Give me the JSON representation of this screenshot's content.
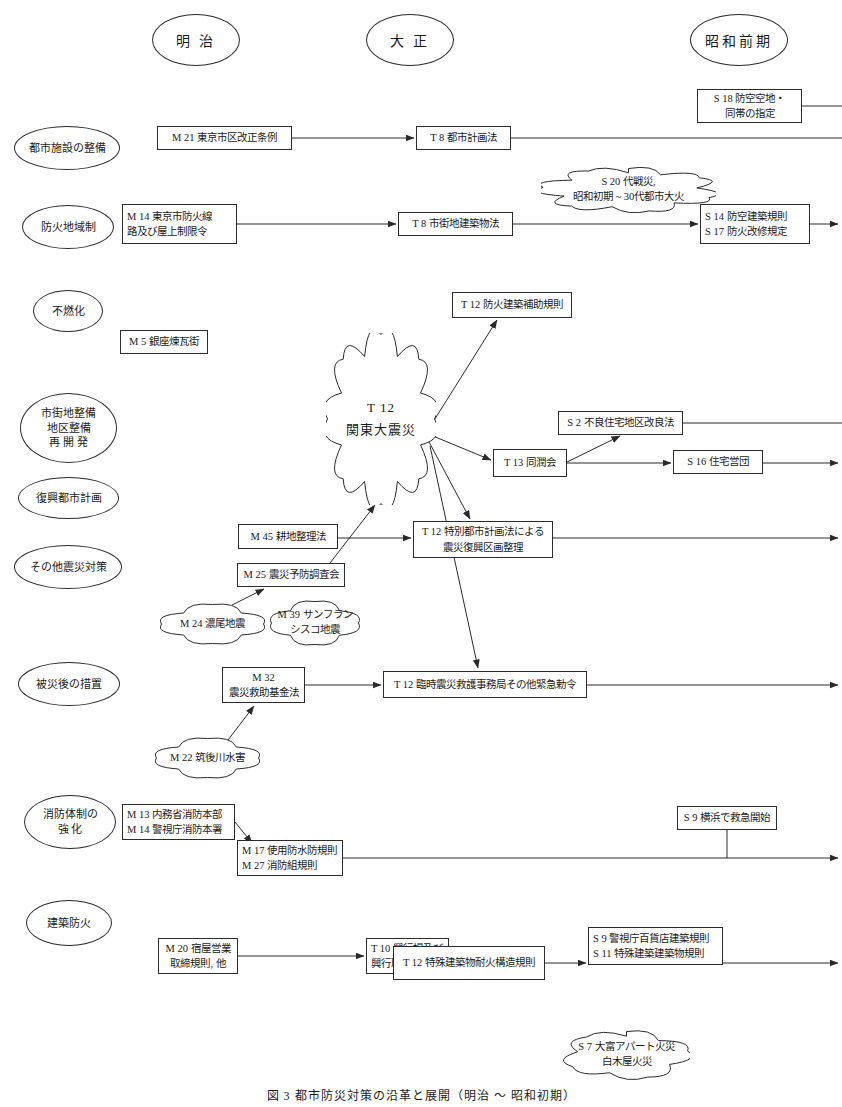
{
  "diagram": {
    "caption": "図 3    都市防災対策の沿革と展開（明治 ～ 昭和初期）",
    "eras": [
      {
        "id": "meiji",
        "label": "明 治",
        "x": 152,
        "y": 14,
        "w": 86,
        "h": 50
      },
      {
        "id": "taisho",
        "label": "大 正",
        "x": 366,
        "y": 14,
        "w": 86,
        "h": 50
      },
      {
        "id": "showa",
        "label": "昭和前期",
        "x": 690,
        "y": 14,
        "w": 96,
        "h": 50
      }
    ],
    "categories": [
      {
        "id": "urban-facilities",
        "lines": [
          "都市施設の整備"
        ],
        "x": 14,
        "y": 126,
        "w": 104,
        "h": 42
      },
      {
        "id": "fire-zone",
        "lines": [
          "防火地域制"
        ],
        "x": 22,
        "y": 205,
        "w": 90,
        "h": 42
      },
      {
        "id": "noncombustible",
        "lines": [
          "不燃化"
        ],
        "x": 33,
        "y": 290,
        "w": 68,
        "h": 40
      },
      {
        "id": "area-improvement",
        "lines": [
          "市街地整備",
          "地区整備",
          "再 開 発"
        ],
        "x": 20,
        "y": 393,
        "w": 95,
        "h": 68
      },
      {
        "id": "recovery-plan",
        "lines": [
          "復興都市計画"
        ],
        "x": 18,
        "y": 477,
        "w": 99,
        "h": 40
      },
      {
        "id": "other-quake",
        "lines": [
          "その他震災対策"
        ],
        "x": 14,
        "y": 545,
        "w": 106,
        "h": 42
      },
      {
        "id": "post-disaster",
        "lines": [
          "被災後の措置"
        ],
        "x": 18,
        "y": 662,
        "w": 100,
        "h": 42
      },
      {
        "id": "firefighting",
        "lines": [
          "消防体制の",
          "強  化"
        ],
        "x": 24,
        "y": 795,
        "w": 90,
        "h": 52
      },
      {
        "id": "building-fire",
        "lines": [
          "建築防火"
        ],
        "x": 26,
        "y": 900,
        "w": 84,
        "h": 44
      }
    ],
    "boxes": [
      {
        "id": "s18-air-defense-open-space",
        "lines": [
          "S 18 防空空地・",
          "同帯の指定"
        ],
        "x": 697,
        "y": 89,
        "w": 105,
        "h": 34,
        "align": "center"
      },
      {
        "id": "m21-tokyo-ward-revision",
        "lines": [
          "M 21 東京市区改正条例"
        ],
        "x": 157,
        "y": 126,
        "w": 135,
        "h": 24,
        "align": "center"
      },
      {
        "id": "t8-city-planning-act",
        "lines": [
          "T 8 都市計画法"
        ],
        "x": 416,
        "y": 126,
        "w": 95,
        "h": 24,
        "align": "center"
      },
      {
        "id": "m14-fireproof-line",
        "lines": [
          "M 14 東京市防火線",
          "路及び屋上制限令"
        ],
        "x": 122,
        "y": 204,
        "w": 115,
        "h": 40,
        "align": "left"
      },
      {
        "id": "t8-urban-building-act",
        "lines": [
          "T 8 市街地建築物法"
        ],
        "x": 398,
        "y": 212,
        "w": 115,
        "h": 24,
        "align": "center"
      },
      {
        "id": "s14-s17-fireproof-rules",
        "lines": [
          "S 14 防空建築規則",
          "S 17 防火改修規定"
        ],
        "x": 700,
        "y": 204,
        "w": 110,
        "h": 40,
        "align": "left"
      },
      {
        "id": "m5-ginza-brick-town",
        "lines": [
          "M 5 銀座煉瓦街"
        ],
        "x": 120,
        "y": 330,
        "w": 88,
        "h": 24,
        "align": "center"
      },
      {
        "id": "t12-fireproof-subsidy",
        "lines": [
          "T 12 防火建築補助規則"
        ],
        "x": 452,
        "y": 292,
        "w": 120,
        "h": 26,
        "align": "center"
      },
      {
        "id": "s2-poor-housing-improve",
        "lines": [
          "S 2 不良住宅地区改良法"
        ],
        "x": 558,
        "y": 411,
        "w": 125,
        "h": 24,
        "align": "center"
      },
      {
        "id": "t13-dojunkai",
        "lines": [
          "T 13 同潤会"
        ],
        "x": 493,
        "y": 449,
        "w": 74,
        "h": 28,
        "align": "center"
      },
      {
        "id": "s16-housing-corp",
        "lines": [
          "S 16 住宅営団"
        ],
        "x": 673,
        "y": 450,
        "w": 90,
        "h": 24,
        "align": "center"
      },
      {
        "id": "m45-land-rearrangement",
        "lines": [
          "M 45 耕地整理法"
        ],
        "x": 238,
        "y": 524,
        "w": 100,
        "h": 25,
        "align": "center"
      },
      {
        "id": "t12-special-city-planning",
        "lines": [
          "T 12 特別都市計画法による",
          "震災復興区画整理"
        ],
        "x": 413,
        "y": 521,
        "w": 140,
        "h": 37,
        "align": "center"
      },
      {
        "id": "m25-quake-prevention-comm",
        "lines": [
          "M 25 震災予防調査会"
        ],
        "x": 237,
        "y": 563,
        "w": 108,
        "h": 24,
        "align": "center"
      },
      {
        "id": "m32-quake-relief-fund",
        "lines": [
          "M 32",
          "震災救助基金法"
        ],
        "x": 222,
        "y": 667,
        "w": 83,
        "h": 36,
        "align": "center"
      },
      {
        "id": "t12-emergency-relief-office",
        "lines": [
          "T 12 臨時震災救護事務局その他緊急勅令"
        ],
        "x": 383,
        "y": 671,
        "w": 204,
        "h": 27,
        "align": "center"
      },
      {
        "id": "m13-m14-fire-hq",
        "lines": [
          "M 13 内務省消防本部",
          "M 14 警視庁消防本署"
        ],
        "x": 122,
        "y": 804,
        "w": 113,
        "h": 36,
        "align": "left"
      },
      {
        "id": "s9-yokohama-ambulance",
        "lines": [
          "S 9 横浜で救急開始"
        ],
        "x": 677,
        "y": 806,
        "w": 100,
        "h": 24,
        "align": "center"
      },
      {
        "id": "m17-m27-fire-rules",
        "lines": [
          "M 17 使用防水防規則",
          "M 27 消防組規則"
        ],
        "x": 237,
        "y": 840,
        "w": 106,
        "h": 36,
        "align": "left"
      },
      {
        "id": "m20-inn-business-rules",
        "lines": [
          "M 20 宿屋営業",
          "取締規則, 他"
        ],
        "x": 158,
        "y": 938,
        "w": 80,
        "h": 36,
        "align": "center"
      },
      {
        "id": "t10-theatre-rules",
        "lines": [
          "T 10 興行場及び",
          "興行取締規則"
        ],
        "x": 366,
        "y": 938,
        "w": 83,
        "h": 36,
        "align": "left"
      },
      {
        "id": "t12-special-building-fire",
        "lines": [
          "T 12 特殊建築物耐火構造規則"
        ],
        "x": 393,
        "y": 946,
        "w": 152,
        "h": 34,
        "align": "center"
      },
      {
        "id": "s9-s11-building-rules",
        "lines": [
          "S 9 警視庁百貨店建築規則",
          "S 11 特殊建築建築物規則"
        ],
        "x": 588,
        "y": 927,
        "w": 135,
        "h": 38,
        "align": "left"
      }
    ],
    "clouds": [
      {
        "id": "s20-war-damage",
        "lines": [
          "S 20 代戦災,",
          "昭和初期 ~ 30代都市大火"
        ],
        "x": 541,
        "y": 167,
        "w": 175,
        "h": 46
      },
      {
        "id": "t12-great-kanto-quake",
        "lines": [
          "T 12",
          "関東大震災"
        ],
        "x": 326,
        "y": 333,
        "w": 110,
        "h": 172,
        "big": true
      },
      {
        "id": "m24-nobi-quake",
        "lines": [
          "M 24 濃尾地震"
        ],
        "x": 160,
        "y": 603,
        "w": 105,
        "h": 42
      },
      {
        "id": "m39-sanfrancisco-quake",
        "lines": [
          "M 39 サンフラン",
          "シスコ地震"
        ],
        "x": 270,
        "y": 600,
        "w": 90,
        "h": 46
      },
      {
        "id": "m22-chikugo-flood",
        "lines": [
          "M 22 筑後川水害"
        ],
        "x": 155,
        "y": 737,
        "w": 105,
        "h": 42
      },
      {
        "id": "s7-otomi-apartment-fire",
        "lines": [
          "S 7 大富アパート火災",
          "白木屋火災"
        ],
        "x": 563,
        "y": 1030,
        "w": 127,
        "h": 50
      }
    ],
    "connectors": [
      {
        "id": "s18-to-right-edge",
        "type": "line",
        "from": [
          802,
          106
        ],
        "to": [
          842,
          106
        ]
      },
      {
        "id": "m21-to-t8-city-planning",
        "type": "arrow",
        "from": [
          292,
          138
        ],
        "to": [
          414,
          138
        ]
      },
      {
        "id": "t8-city-planning-to-right",
        "type": "line",
        "from": [
          511,
          138
        ],
        "to": [
          842,
          138
        ]
      },
      {
        "id": "m14-to-t8-urban-building",
        "type": "arrow",
        "from": [
          237,
          224
        ],
        "to": [
          396,
          224
        ]
      },
      {
        "id": "t8-urban-building-to-s14",
        "type": "arrow",
        "from": [
          513,
          224
        ],
        "to": [
          698,
          224
        ]
      },
      {
        "id": "s14-to-right-edge",
        "type": "arrow",
        "from": [
          810,
          224
        ],
        "to": [
          838,
          224
        ]
      },
      {
        "id": "kanto-to-t12-subsidy",
        "type": "arrow",
        "from": [
          428,
          430
        ],
        "to": [
          497,
          320
        ]
      },
      {
        "id": "kanto-to-t13-dojunkai",
        "type": "arrow",
        "from": [
          428,
          434
        ],
        "to": [
          491,
          460
        ]
      },
      {
        "id": "t13-to-s2-poor-housing",
        "type": "arrow",
        "from": [
          567,
          462
        ],
        "to": [
          620,
          436
        ]
      },
      {
        "id": "s2-to-right-edge",
        "type": "line",
        "from": [
          683,
          423
        ],
        "to": [
          842,
          423
        ]
      },
      {
        "id": "t13-to-s16-housing",
        "type": "arrow",
        "from": [
          567,
          463
        ],
        "to": [
          671,
          463
        ]
      },
      {
        "id": "s16-to-right-edge",
        "type": "arrow",
        "from": [
          763,
          463
        ],
        "to": [
          838,
          463
        ]
      },
      {
        "id": "kanto-to-t12-special-plan",
        "type": "arrow",
        "from": [
          428,
          440
        ],
        "to": [
          470,
          519
        ]
      },
      {
        "id": "m45-to-t12-special-plan",
        "type": "arrow",
        "from": [
          338,
          538
        ],
        "to": [
          411,
          538
        ]
      },
      {
        "id": "m25-to-kanto",
        "type": "arrow",
        "from": [
          330,
          563
        ],
        "to": [
          375,
          505
        ]
      },
      {
        "id": "t12-special-plan-to-right",
        "type": "arrow",
        "from": [
          553,
          538
        ],
        "to": [
          838,
          538
        ]
      },
      {
        "id": "m24-to-m25",
        "type": "arrow",
        "from": [
          232,
          605
        ],
        "to": [
          264,
          589
        ]
      },
      {
        "id": "kanto-to-t12-emergency",
        "type": "arrow",
        "from": [
          430,
          446
        ],
        "to": [
          478,
          668
        ]
      },
      {
        "id": "m32-to-t12-emergency",
        "type": "arrow",
        "from": [
          305,
          685
        ],
        "to": [
          381,
          685
        ]
      },
      {
        "id": "t12-emergency-to-right",
        "type": "arrow",
        "from": [
          587,
          685
        ],
        "to": [
          838,
          685
        ]
      },
      {
        "id": "m22-to-m32",
        "type": "arrow",
        "from": [
          228,
          740
        ],
        "to": [
          254,
          706
        ]
      },
      {
        "id": "m13-to-m17",
        "type": "arrow",
        "from": [
          235,
          822
        ],
        "to": [
          252,
          843
        ]
      },
      {
        "id": "m17-to-right-edge",
        "type": "arrow",
        "from": [
          343,
          858
        ],
        "to": [
          838,
          858
        ]
      },
      {
        "id": "s9-ambulance-drop",
        "type": "line",
        "from": [
          727,
          830
        ],
        "to": [
          727,
          858
        ]
      },
      {
        "id": "m20-to-t10-theatre",
        "type": "arrow",
        "from": [
          238,
          956
        ],
        "to": [
          364,
          956
        ]
      },
      {
        "id": "t12-special-bldg-to-s9",
        "type": "arrow",
        "from": [
          545,
          963
        ],
        "to": [
          586,
          963
        ]
      },
      {
        "id": "s9-s11-to-right-edge",
        "type": "arrow",
        "from": [
          723,
          963
        ],
        "to": [
          838,
          963
        ]
      }
    ]
  }
}
